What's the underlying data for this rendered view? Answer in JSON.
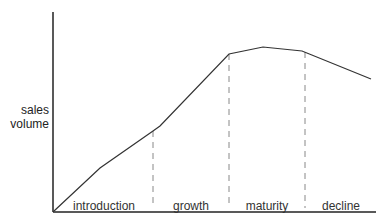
{
  "diagram": {
    "type": "product-life-cycle",
    "y_axis_label_line1": "sales",
    "y_axis_label_line2": "volume",
    "stages": [
      {
        "label": "introduction",
        "center_x": 105
      },
      {
        "label": "growth",
        "center_x": 190
      },
      {
        "label": "maturity",
        "center_x": 267
      },
      {
        "label": "decline",
        "center_x": 340
      }
    ],
    "stage_boundaries_x": [
      153,
      229,
      305
    ],
    "curve_points": [
      [
        54,
        211
      ],
      [
        100,
        168
      ],
      [
        153,
        131
      ],
      [
        160,
        126
      ],
      [
        229,
        54
      ],
      [
        263,
        47
      ],
      [
        302,
        51
      ],
      [
        371,
        79
      ]
    ],
    "colors": {
      "line": "#333333",
      "dash": "#888888",
      "text": "#222222"
    }
  }
}
